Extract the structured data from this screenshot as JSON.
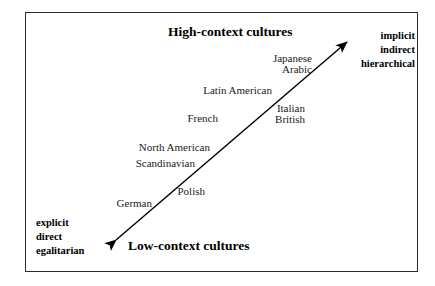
{
  "diagram": {
    "type": "context-culture-continuum",
    "top_title": "High-context cultures",
    "bottom_title": "Low-context cultures",
    "high_context_traits": {
      "line1": "implicit",
      "line2": "indirect",
      "line3": "hierarchical"
    },
    "low_context_traits": {
      "line1": "explicit",
      "line2": "direct",
      "line3": "egalitarian"
    },
    "cultures": [
      {
        "label": "Japanese"
      },
      {
        "label": "Arabic"
      },
      {
        "label": "Latin American"
      },
      {
        "label": "Italian"
      },
      {
        "label": "French"
      },
      {
        "label": "British"
      },
      {
        "label": "North American"
      },
      {
        "label": "Scandinavian"
      },
      {
        "label": "Polish"
      },
      {
        "label": "German"
      }
    ],
    "colors": {
      "border": "#2a2a2a",
      "arrow": "#000000",
      "text": "#111111",
      "background": "#ffffff"
    }
  }
}
